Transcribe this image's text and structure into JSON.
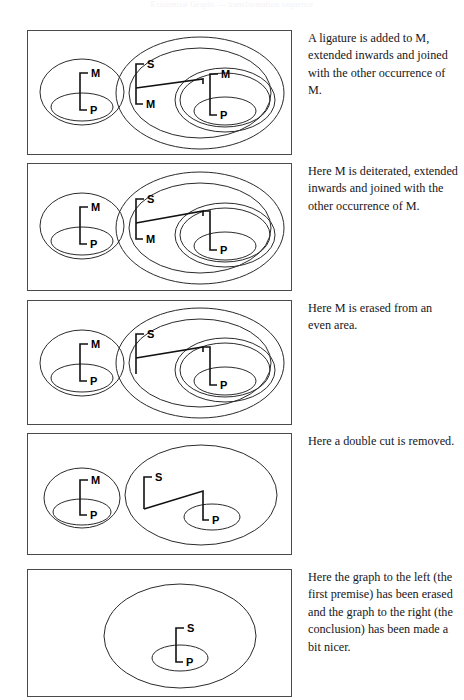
{
  "page": {
    "running_header": "Existential Graphs — transformation sequence",
    "figure_count": 5
  },
  "figures": [
    {
      "id": "panel-1",
      "caption": "A ligature is added to M, extended inwards and joined with the other occurrence of M.",
      "left_graph": {
        "present": true,
        "labels": [
          "M",
          "P"
        ],
        "cuts": 2,
        "description": "outer cut containing M, inner cut containing P, ligature joining M to P"
      },
      "right_graph": {
        "present": true,
        "labels": [
          "S",
          "M",
          "M",
          "P"
        ],
        "cuts": 4,
        "description": "outer cut, second cut containing S-M ligature, inner double cut containing M-P ligature, new ligature joining the two M occurrences"
      }
    },
    {
      "id": "panel-2",
      "caption": "Here M is deiterated, extended inwards and joined with the other occurrence of M.",
      "left_graph": {
        "present": true,
        "labels": [
          "M",
          "P"
        ],
        "cuts": 2,
        "description": "outer cut containing M, inner cut containing P, ligature joining M to P"
      },
      "right_graph": {
        "present": true,
        "labels": [
          "S",
          "M",
          "P"
        ],
        "cuts": 4,
        "description": "inner M label removed, ligature continues unlabelled into the inner double cut to P"
      }
    },
    {
      "id": "panel-3",
      "caption": "Here M is erased from an even area.",
      "left_graph": {
        "present": true,
        "labels": [
          "M",
          "P"
        ],
        "cuts": 2,
        "description": "outer cut containing M, inner cut containing P, ligature joining M to P"
      },
      "right_graph": {
        "present": true,
        "labels": [
          "S",
          "P"
        ],
        "cuts": 4,
        "description": "both M labels erased, bare ligature from S down and across into the inner double cut to P"
      }
    },
    {
      "id": "panel-4",
      "caption": "Here a double cut is removed.",
      "left_graph": {
        "present": true,
        "labels": [
          "M",
          "P"
        ],
        "cuts": 2,
        "description": "outer cut containing M, inner cut containing P, ligature joining M to P"
      },
      "right_graph": {
        "present": true,
        "labels": [
          "S",
          "P"
        ],
        "cuts": 2,
        "description": "double cut removed leaving one outer cut and the inner P cut, ligature from S across to P"
      }
    },
    {
      "id": "panel-5",
      "caption": "Here the graph to the left (the first premise) has been erased and the graph to the right (the conclusion) has been made a bit nicer.",
      "left_graph": {
        "present": false,
        "labels": [],
        "cuts": 0,
        "description": "erased"
      },
      "right_graph": {
        "present": true,
        "labels": [
          "S",
          "P"
        ],
        "cuts": 2,
        "description": "outer cut containing S, inner cut containing P, straight vertical ligature joining S to P"
      }
    }
  ],
  "colors": {
    "page_background": "#ffffff",
    "panel_border": "#4a4a4a",
    "cut_stroke": "#2b2b2b",
    "ligature_stroke": "#111111",
    "label_text": "#000000",
    "caption_text": "#16161a"
  }
}
